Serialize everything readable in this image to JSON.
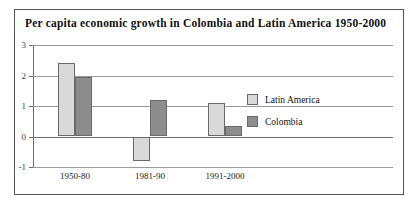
{
  "chart_data": {
    "type": "bar",
    "title": "Per capita economic growth in Colombia and Latin America 1950-2000",
    "xlabel": "",
    "ylabel": "",
    "categories": [
      "1950-80",
      "1981-90",
      "1991-2000"
    ],
    "series": [
      {
        "name": "Latin America",
        "color": "#d9d9d9",
        "values": [
          2.4,
          -0.8,
          1.1
        ]
      },
      {
        "name": "Colombia",
        "color": "#8d8d8d",
        "values": [
          1.95,
          1.2,
          0.35
        ]
      }
    ],
    "ylim": [
      -1,
      3
    ],
    "yticks": [
      3,
      2,
      1,
      0,
      -1
    ],
    "ytick_labels": [
      "3",
      "2",
      "1",
      "0",
      "-1"
    ],
    "grid": true,
    "legend_position": "right-inside",
    "legend": [
      "Latin America",
      "Colombia"
    ]
  }
}
